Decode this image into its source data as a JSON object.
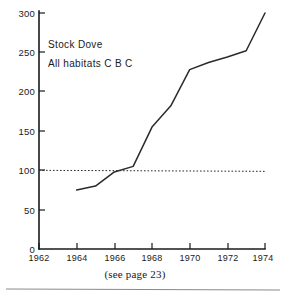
{
  "chart_data": {
    "type": "line",
    "title": "Stock Dove",
    "subtitle": "All habitats C B C",
    "xlabel": "",
    "ylabel": "",
    "xlim": [
      1962,
      1974
    ],
    "ylim": [
      0,
      300
    ],
    "grid": false,
    "legend_position": "none",
    "x_ticks": [
      1962,
      1964,
      1966,
      1968,
      1970,
      1972,
      1974
    ],
    "x_tick_labels": [
      "1962",
      "1964",
      "1966",
      "1968",
      "1970",
      "1972",
      "1974"
    ],
    "y_ticks": [
      0,
      50,
      100,
      150,
      200,
      250,
      300
    ],
    "y_tick_labels": [
      "0",
      "50",
      "100",
      "150",
      "200",
      "250",
      "300"
    ],
    "series": [
      {
        "name": "Stock Dove index",
        "x": [
          1964,
          1965,
          1966,
          1967,
          1968,
          1969,
          1970,
          1971,
          1972,
          1973,
          1974
        ],
        "values": [
          75,
          80,
          98,
          105,
          155,
          182,
          228,
          237,
          244,
          252,
          300
        ]
      }
    ],
    "reference_line": {
      "name": "baseline index 100",
      "value": 100,
      "style": "dotted",
      "x_from": 1962,
      "x_to": 1974
    },
    "annotations": [
      {
        "text": "Stock Dove",
        "x": 1964.2,
        "y": 262
      },
      {
        "text": "All habitats C B C",
        "x": 1964.2,
        "y": 240
      }
    ],
    "caption": "(see page 23)"
  },
  "colors": {
    "line": "#2a2a2a",
    "axis": "#1a1a1a",
    "reference": "#2a2a2a",
    "rule": "#8a8a8a",
    "background": "#ffffff"
  }
}
